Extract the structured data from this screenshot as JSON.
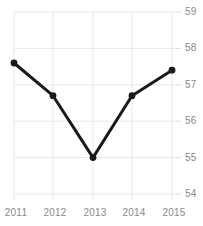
{
  "chart_data": {
    "type": "line",
    "title": "",
    "subtitle": "",
    "xlabel": "",
    "ylabel": "",
    "categories": [
      "2011",
      "2012",
      "2013",
      "2014",
      "2015"
    ],
    "x": [
      2011,
      2012,
      2013,
      2014,
      2015
    ],
    "values": [
      57.6,
      56.7,
      55.0,
      56.7,
      57.4
    ],
    "series": [
      {
        "name": "",
        "values": [
          57.6,
          56.7,
          55.0,
          56.7,
          57.4
        ]
      }
    ],
    "ylim": [
      54,
      59
    ],
    "xlim": [
      2011,
      2015
    ],
    "y_ticks": [
      54,
      55,
      56,
      57,
      58,
      59
    ],
    "y_tick_labels": [
      "54",
      "55",
      "56",
      "57",
      "58",
      "59"
    ],
    "x_ticks": [
      2011,
      2012,
      2013,
      2014,
      2015
    ],
    "x_tick_labels": [
      "2011",
      "2012",
      "2013",
      "2014",
      "2015"
    ],
    "grid": true,
    "grid_x": true,
    "grid_y": true,
    "legend": false,
    "legend_position": "none",
    "y_axis_side": "right",
    "markers": "circle",
    "annotations": []
  },
  "style": {
    "line_color": "#1a1a1a",
    "marker_color": "#1a1a1a",
    "grid_color": "#e8e8e8",
    "tick_label_color": "#8a8a8a",
    "background_color": "#ffffff",
    "line_width": "3",
    "marker_radius": "3.4"
  },
  "axis": {
    "y_labels": {
      "t59": "59",
      "t58": "58",
      "t57": "57",
      "t56": "56",
      "t55": "55",
      "t54": "54"
    },
    "x_labels": {
      "p2011": "2011",
      "p2012": "2012",
      "p2013": "2013",
      "p2014": "2014",
      "p2015": "2015"
    }
  }
}
